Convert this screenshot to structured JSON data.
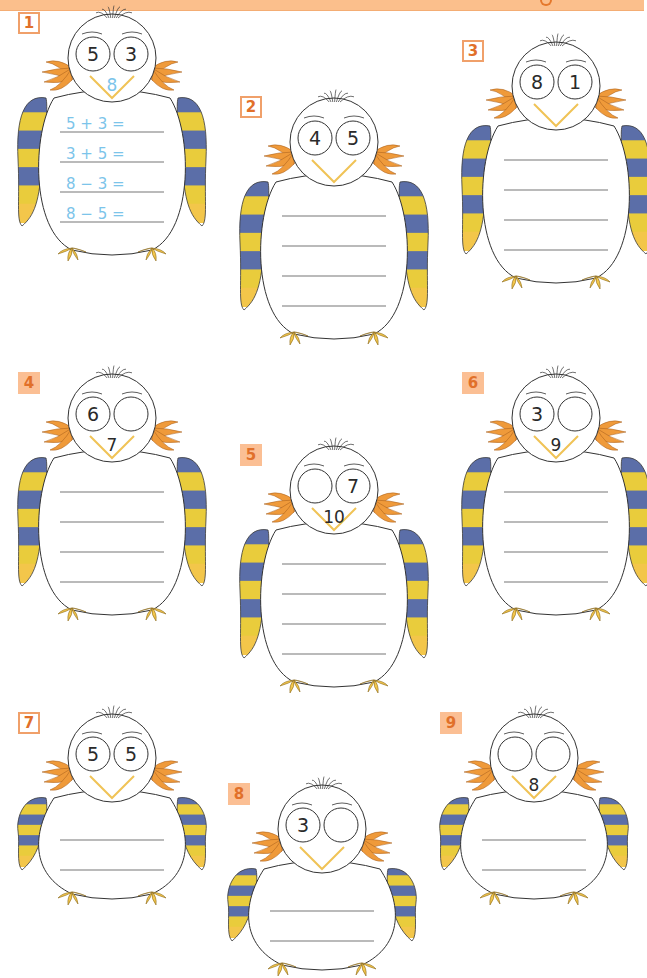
{
  "header": {
    "bar_color": "#fbbf8c"
  },
  "colors": {
    "label_text": "#e1702a",
    "label_border": "#f0a06a",
    "label_fill": "#fbbf94",
    "stripe_blue": "#5b6ea8",
    "stripe_yellow": "#e9cc3c",
    "feet": "#f3c64a",
    "tuft": "#ef9a3a",
    "beak": "#f0c356",
    "example_text": "#7cc4ea",
    "line": "#777777"
  },
  "exercises": [
    {
      "number": "1",
      "label_style": "outlined",
      "eye_left": "5",
      "eye_right": "3",
      "beak": "8",
      "beak_style": "example",
      "line_count": 4,
      "equations": [
        "5 + 3 =",
        "3 + 5 =",
        "8 − 3 =",
        "8 − 5 ="
      ],
      "x": 18,
      "y": 12,
      "w": 185,
      "h": 245
    },
    {
      "number": "2",
      "label_style": "outlined",
      "eye_left": "4",
      "eye_right": "5",
      "beak": "",
      "beak_style": "normal",
      "line_count": 4,
      "equations": [],
      "x": 240,
      "y": 96,
      "w": 185,
      "h": 245
    },
    {
      "number": "3",
      "label_style": "outlined",
      "eye_left": "8",
      "eye_right": "1",
      "beak": "",
      "beak_style": "normal",
      "line_count": 4,
      "equations": [],
      "x": 462,
      "y": 40,
      "w": 185,
      "h": 245
    },
    {
      "number": "4",
      "label_style": "filled",
      "eye_left": "6",
      "eye_right": "",
      "beak": "7",
      "beak_style": "normal",
      "line_count": 4,
      "equations": [],
      "x": 18,
      "y": 372,
      "w": 185,
      "h": 245
    },
    {
      "number": "5",
      "label_style": "filled",
      "eye_left": "",
      "eye_right": "7",
      "beak": "10",
      "beak_style": "normal",
      "line_count": 4,
      "equations": [],
      "x": 240,
      "y": 444,
      "w": 185,
      "h": 245
    },
    {
      "number": "6",
      "label_style": "filled",
      "eye_left": "3",
      "eye_right": "",
      "beak": "9",
      "beak_style": "normal",
      "line_count": 4,
      "equations": [],
      "x": 462,
      "y": 372,
      "w": 185,
      "h": 245
    },
    {
      "number": "7",
      "label_style": "outlined",
      "eye_left": "5",
      "eye_right": "5",
      "beak": "",
      "beak_style": "normal",
      "line_count": 2,
      "equations": [],
      "x": 18,
      "y": 712,
      "w": 185,
      "h": 190
    },
    {
      "number": "8",
      "label_style": "filled",
      "eye_left": "3",
      "eye_right": "",
      "beak": "",
      "beak_style": "normal",
      "line_count": 2,
      "equations": [],
      "x": 228,
      "y": 783,
      "w": 185,
      "h": 190
    },
    {
      "number": "9",
      "label_style": "filled",
      "eye_left": "",
      "eye_right": "",
      "beak": "8",
      "beak_style": "normal",
      "line_count": 2,
      "equations": [],
      "x": 440,
      "y": 712,
      "w": 185,
      "h": 190
    }
  ]
}
